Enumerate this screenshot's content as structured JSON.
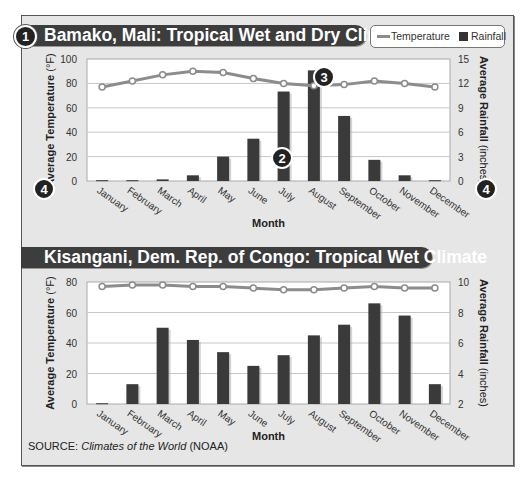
{
  "legend": {
    "temperature_label": "Temperature",
    "rainfall_label": "Rainfall",
    "temperature_color": "#8c8c8c",
    "rainfall_color": "#333333"
  },
  "source": {
    "prefix": "SOURCE: ",
    "title": "Climates of the World",
    "suffix": " (NOAA)"
  },
  "badges": {
    "b1": "1",
    "b2": "2",
    "b3": "3",
    "b4": "4"
  },
  "chart_data": [
    {
      "type": "bar",
      "title": "Bamako, Mali: Tropical Wet and Dry Climate",
      "categories": [
        "January",
        "February",
        "March",
        "April",
        "May",
        "June",
        "July",
        "August",
        "September",
        "October",
        "November",
        "December"
      ],
      "xlabel": "Month",
      "ylabel": "Average Temperature (°F)",
      "y2label": "Average Rainfall (inches)",
      "ylim": [
        0,
        100
      ],
      "y2lim": [
        0,
        15
      ],
      "yticks": [
        0,
        20,
        40,
        60,
        80,
        100
      ],
      "y2ticks": [
        0,
        3,
        6,
        9,
        12,
        15
      ],
      "grid": true,
      "legend_position": "top-right",
      "series": [
        {
          "name": "Temperature",
          "type": "line",
          "axis": "left",
          "values": [
            77,
            82,
            87,
            90,
            89,
            84,
            80,
            78,
            79,
            82,
            80,
            77
          ]
        },
        {
          "name": "Rainfall",
          "type": "bar",
          "axis": "right",
          "values": [
            0.1,
            0.1,
            0.2,
            0.7,
            3.0,
            5.2,
            11.0,
            13.6,
            8.0,
            2.6,
            0.7,
            0.1
          ]
        }
      ],
      "annotations": [
        {
          "label": "2",
          "at": "July rainfall bar"
        },
        {
          "label": "3",
          "at": "August temperature point"
        },
        {
          "label": "4",
          "at": "left and right axis labels"
        }
      ]
    },
    {
      "type": "bar",
      "title": "Kisangani, Dem. Rep. of Congo: Tropical Wet Climate",
      "categories": [
        "January",
        "February",
        "March",
        "April",
        "May",
        "June",
        "July",
        "August",
        "September",
        "October",
        "November",
        "December"
      ],
      "xlabel": "Month",
      "ylabel": "Average Temperature (°F)",
      "y2label": "Average Rainfall (inches)",
      "ylim": [
        0,
        80
      ],
      "y2lim": [
        2,
        10
      ],
      "yticks": [
        0,
        20,
        40,
        60,
        80
      ],
      "y2ticks": [
        2,
        4,
        6,
        8,
        10
      ],
      "grid": true,
      "series": [
        {
          "name": "Temperature",
          "type": "line",
          "axis": "left",
          "values": [
            77,
            78,
            78,
            77,
            77,
            76,
            75,
            75,
            76,
            77,
            76,
            76
          ]
        },
        {
          "name": "Rainfall",
          "type": "bar",
          "axis": "right",
          "values": [
            2.05,
            3.3,
            7.0,
            6.2,
            5.4,
            4.5,
            5.2,
            6.5,
            7.2,
            8.6,
            7.8,
            3.3
          ]
        }
      ]
    }
  ]
}
